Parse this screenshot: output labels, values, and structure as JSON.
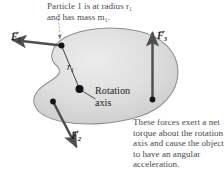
{
  "figure": {
    "annotations": {
      "top": "Particle 1 is at radius r₁\nand has mass m₁.",
      "bottom": "These forces exert a net\ntorque about the rotation\naxis and cause the object\nto have an angular\nacceleration."
    },
    "axis_label": "Rotation\naxis",
    "radius_label": {
      "symbol": "r",
      "subscript": "1"
    },
    "forces": [
      {
        "id": "F1",
        "symbol": "F",
        "subscript": "1",
        "vector_accent": "⃗",
        "direction": "left-and-slightly-up",
        "origin": "particle-1"
      },
      {
        "id": "F2",
        "symbol": "F",
        "subscript": "2",
        "vector_accent": "⃗",
        "direction": "down-and-right",
        "origin": "lower-left-point"
      },
      {
        "id": "F3",
        "symbol": "F",
        "subscript": "3",
        "vector_accent": "⃗",
        "direction": "up",
        "origin": "right-point"
      }
    ],
    "colors": {
      "body_fill": "#d9d9d9",
      "body_stroke": "#8a8a8a",
      "arrow": "#4f4f4f",
      "dot": "#1a1a1a",
      "text": "#4a4a4a",
      "label_text": "#1d1d1d",
      "background": "#ffffff"
    }
  }
}
